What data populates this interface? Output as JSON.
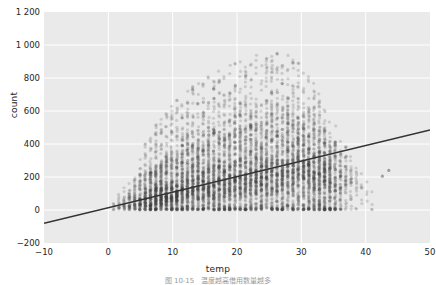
{
  "chart_data": {
    "type": "scatter",
    "title": "",
    "xlabel": "temp",
    "ylabel": "count",
    "xlim": [
      -10,
      50
    ],
    "ylim": [
      -200,
      1200
    ],
    "xticks": [
      -10,
      0,
      10,
      20,
      30,
      40,
      50
    ],
    "xtick_labels": [
      "−10",
      "0",
      "10",
      "20",
      "30",
      "40",
      "50"
    ],
    "yticks": [
      -200,
      0,
      200,
      400,
      600,
      800,
      1000,
      1200
    ],
    "ytick_labels": [
      "−200",
      "0",
      "200",
      "400",
      "600",
      "800",
      "1 000",
      "1 200"
    ],
    "grid": true,
    "grid_color": "#ffffff",
    "plot_bg": "#eaeaea",
    "figure_bg": "#ffffff",
    "point_color": "#3f3f3f",
    "point_alpha": 0.18,
    "point_size": 2.1,
    "trendline": {
      "color": "#333333",
      "width": 1.6,
      "x_start": -10,
      "y_start": -80,
      "x_end": 50,
      "y_end": 485,
      "slope": 9.42,
      "intercept": 14.2
    },
    "x_step": 0.82,
    "x_data_min": 0.82,
    "x_data_max": 41.0,
    "y_data_min": 1,
    "y_data_max": 970,
    "n_points": 10886,
    "columns": [
      {
        "x": 0.82,
        "n": 7,
        "ymax": 70,
        "q50": 22,
        "shape": 2.1
      },
      {
        "x": 1.64,
        "n": 14,
        "ymax": 95,
        "q50": 26,
        "shape": 2.1
      },
      {
        "x": 2.46,
        "n": 22,
        "ymax": 135,
        "q50": 31,
        "shape": 2.1
      },
      {
        "x": 3.28,
        "n": 35,
        "ymax": 190,
        "q50": 37,
        "shape": 2.1
      },
      {
        "x": 4.1,
        "n": 48,
        "ymax": 245,
        "q50": 44,
        "shape": 2.1
      },
      {
        "x": 4.92,
        "n": 70,
        "ymax": 330,
        "q50": 52,
        "shape": 2.1
      },
      {
        "x": 5.74,
        "n": 95,
        "ymax": 400,
        "q50": 62,
        "shape": 2.1
      },
      {
        "x": 6.56,
        "n": 120,
        "ymax": 450,
        "q50": 72,
        "shape": 2.1
      },
      {
        "x": 7.38,
        "n": 150,
        "ymax": 520,
        "q50": 84,
        "shape": 2.1
      },
      {
        "x": 8.2,
        "n": 185,
        "ymax": 560,
        "q50": 96,
        "shape": 2.1
      },
      {
        "x": 9.02,
        "n": 215,
        "ymax": 600,
        "q50": 108,
        "shape": 2.1
      },
      {
        "x": 9.84,
        "n": 245,
        "ymax": 640,
        "q50": 120,
        "shape": 2.1
      },
      {
        "x": 10.66,
        "n": 275,
        "ymax": 680,
        "q50": 132,
        "shape": 2.1
      },
      {
        "x": 11.48,
        "n": 300,
        "ymax": 700,
        "q50": 143,
        "shape": 2.1
      },
      {
        "x": 12.3,
        "n": 320,
        "ymax": 730,
        "q50": 154,
        "shape": 2.1
      },
      {
        "x": 13.12,
        "n": 340,
        "ymax": 760,
        "q50": 165,
        "shape": 2.1
      },
      {
        "x": 13.94,
        "n": 355,
        "ymax": 780,
        "q50": 176,
        "shape": 2.1
      },
      {
        "x": 14.76,
        "n": 370,
        "ymax": 800,
        "q50": 187,
        "shape": 2.1
      },
      {
        "x": 15.58,
        "n": 385,
        "ymax": 820,
        "q50": 198,
        "shape": 2.1
      },
      {
        "x": 16.4,
        "n": 395,
        "ymax": 845,
        "q50": 208,
        "shape": 2.1
      },
      {
        "x": 17.22,
        "n": 405,
        "ymax": 860,
        "q50": 218,
        "shape": 2.1
      },
      {
        "x": 18.04,
        "n": 415,
        "ymax": 880,
        "q50": 228,
        "shape": 2.1
      },
      {
        "x": 18.86,
        "n": 420,
        "ymax": 895,
        "q50": 238,
        "shape": 2.1
      },
      {
        "x": 19.68,
        "n": 425,
        "ymax": 905,
        "q50": 247,
        "shape": 2.1
      },
      {
        "x": 20.5,
        "n": 430,
        "ymax": 915,
        "q50": 256,
        "shape": 2.1
      },
      {
        "x": 21.32,
        "n": 430,
        "ymax": 925,
        "q50": 264,
        "shape": 2.1
      },
      {
        "x": 22.14,
        "n": 428,
        "ymax": 935,
        "q50": 272,
        "shape": 2.1
      },
      {
        "x": 22.96,
        "n": 425,
        "ymax": 945,
        "q50": 280,
        "shape": 2.1
      },
      {
        "x": 23.78,
        "n": 420,
        "ymax": 955,
        "q50": 288,
        "shape": 2.1
      },
      {
        "x": 24.6,
        "n": 412,
        "ymax": 965,
        "q50": 295,
        "shape": 2.1
      },
      {
        "x": 25.42,
        "n": 402,
        "ymax": 970,
        "q50": 302,
        "shape": 2.1
      },
      {
        "x": 26.24,
        "n": 390,
        "ymax": 968,
        "q50": 308,
        "shape": 2.1
      },
      {
        "x": 27.06,
        "n": 375,
        "ymax": 960,
        "q50": 314,
        "shape": 2.1
      },
      {
        "x": 27.88,
        "n": 358,
        "ymax": 950,
        "q50": 318,
        "shape": 2.1
      },
      {
        "x": 28.7,
        "n": 338,
        "ymax": 930,
        "q50": 322,
        "shape": 2.1
      },
      {
        "x": 29.52,
        "n": 315,
        "ymax": 905,
        "q50": 325,
        "shape": 2.1
      },
      {
        "x": 30.34,
        "n": 288,
        "ymax": 870,
        "q50": 327,
        "shape": 2.1
      },
      {
        "x": 31.16,
        "n": 258,
        "ymax": 830,
        "q50": 328,
        "shape": 2.1
      },
      {
        "x": 31.98,
        "n": 225,
        "ymax": 780,
        "q50": 326,
        "shape": 2.1
      },
      {
        "x": 32.8,
        "n": 190,
        "ymax": 720,
        "q50": 322,
        "shape": 2.1
      },
      {
        "x": 33.62,
        "n": 155,
        "ymax": 660,
        "q50": 316,
        "shape": 2.1
      },
      {
        "x": 34.44,
        "n": 120,
        "ymax": 590,
        "q50": 308,
        "shape": 2.1
      },
      {
        "x": 35.26,
        "n": 88,
        "ymax": 520,
        "q50": 298,
        "shape": 2.1
      },
      {
        "x": 36.08,
        "n": 60,
        "ymax": 450,
        "q50": 285,
        "shape": 2.1
      },
      {
        "x": 36.9,
        "n": 40,
        "ymax": 390,
        "q50": 270,
        "shape": 2.1
      },
      {
        "x": 37.72,
        "n": 25,
        "ymax": 330,
        "q50": 255,
        "shape": 2.1
      },
      {
        "x": 38.54,
        "n": 14,
        "ymax": 270,
        "q50": 235,
        "shape": 2.1
      },
      {
        "x": 39.36,
        "n": 7,
        "ymax": 220,
        "q50": 210,
        "shape": 2.1
      },
      {
        "x": 40.18,
        "n": 3,
        "ymax": 170,
        "q50": 160,
        "shape": 2.1
      },
      {
        "x": 41.0,
        "n": 2,
        "ymax": 130,
        "q50": 110,
        "shape": 2.1
      }
    ],
    "outliers": [
      {
        "x": 43.6,
        "y": 240
      },
      {
        "x": 42.6,
        "y": 205
      }
    ]
  },
  "caption": {
    "text": "图 10-15　温度越高借用数量越多"
  }
}
